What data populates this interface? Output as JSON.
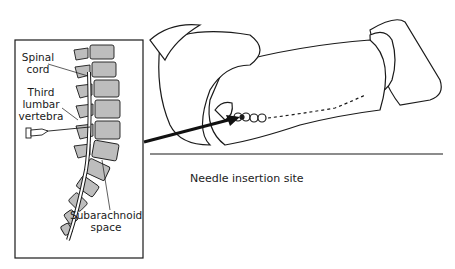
{
  "figure": {
    "caption": "Needle insertion site",
    "inset": {
      "labels": {
        "spinal_cord_line1": "Spinal",
        "spinal_cord_line2": "cord",
        "third_lumbar_line1": "Third",
        "third_lumbar_line2": "lumbar",
        "third_lumbar_line3": "vertebra",
        "subarachnoid_line1": "Subarachnoid",
        "subarachnoid_line2": "space"
      }
    },
    "colors": {
      "line": "#1a1a1a",
      "vertebra_fill": "#bdbdbd",
      "background": "#ffffff"
    }
  }
}
